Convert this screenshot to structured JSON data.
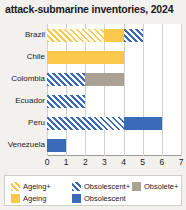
{
  "chart_data": {
    "type": "bar",
    "orientation": "horizontal",
    "stacked": true,
    "title": "attack-submarine inventories, 2024",
    "xlabel": "",
    "ylabel": "",
    "xlim": [
      0,
      7
    ],
    "xticks": [
      0,
      1,
      2,
      3,
      4,
      5,
      6,
      7
    ],
    "grid": true,
    "legend_position": "bottom",
    "categories": [
      "Brazil",
      "Chile",
      "Colombia",
      "Ecuador",
      "Peru",
      "Venezuela"
    ],
    "series": [
      {
        "name": "Ageing+",
        "key": "ageing_plus",
        "color": "#fbc84b",
        "pattern": "hatch",
        "values": [
          3,
          0,
          0,
          0,
          0,
          0
        ]
      },
      {
        "name": "Ageing",
        "key": "ageing",
        "color": "#fbc84b",
        "pattern": "solid",
        "values": [
          1,
          4,
          0,
          0,
          0,
          0
        ]
      },
      {
        "name": "Obsolescent+",
        "key": "obsolescent_plus",
        "color": "#3a6ab8",
        "pattern": "hatch",
        "values": [
          1,
          0,
          2,
          2,
          4,
          0
        ]
      },
      {
        "name": "Obsolescent",
        "key": "obsolescent",
        "color": "#3a6ab8",
        "pattern": "solid",
        "values": [
          0,
          0,
          0,
          0,
          2,
          1
        ]
      },
      {
        "name": "Obsolete+",
        "key": "obsolete_plus",
        "color": "#a9a293",
        "pattern": "solid",
        "values": [
          0,
          0,
          2,
          0,
          0,
          0
        ]
      }
    ],
    "totals": [
      5,
      4,
      4,
      2,
      6,
      1
    ],
    "stack_order": [
      "ageing_plus",
      "ageing",
      "obsolescent_plus",
      "obsolescent",
      "obsolete_plus"
    ]
  },
  "legend": {
    "entries": [
      {
        "label": "Ageing+",
        "key": "ageing_plus",
        "row": 0,
        "col": 0
      },
      {
        "label": "Obsolescent+",
        "key": "obsolescent_plus",
        "row": 0,
        "col": 1
      },
      {
        "label": "Obsolete+",
        "key": "obsolete_plus",
        "row": 0,
        "col": 2
      },
      {
        "label": "Ageing",
        "key": "ageing",
        "row": 1,
        "col": 0
      },
      {
        "label": "Obsolescent",
        "key": "obsolescent",
        "row": 1,
        "col": 1
      }
    ]
  }
}
